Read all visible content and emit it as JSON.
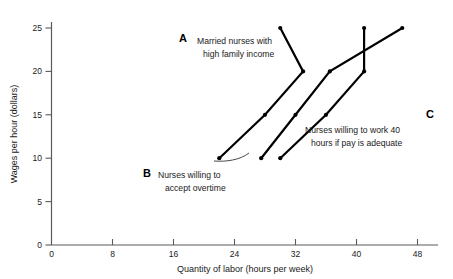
{
  "chart_data": {
    "type": "line",
    "title": "",
    "xlabel": "Quantity of labor (hours per week)",
    "ylabel": "Wages per hour (dollars)",
    "xlim": [
      0,
      50
    ],
    "ylim": [
      0,
      26
    ],
    "xticks": [
      0,
      8,
      16,
      24,
      32,
      40,
      48
    ],
    "yticks": [
      0,
      5,
      10,
      15,
      20,
      25
    ],
    "grid": false,
    "legend_position": "inline-annotations",
    "series": [
      {
        "key": "A",
        "letter": "A",
        "name": "Married nurses with high family income",
        "label_line1": "Married nurses with",
        "label_line2": "high family income",
        "backward_bending": true,
        "x": [
          22,
          28,
          33,
          30
        ],
        "y": [
          10,
          15,
          20,
          25
        ]
      },
      {
        "key": "B",
        "letter": "B",
        "name": "Nurses willing to accept overtime",
        "label_line1": "Nurses willing to",
        "label_line2": "accept overtime",
        "backward_bending": false,
        "x": [
          27.5,
          32,
          36.5,
          46
        ],
        "y": [
          10,
          15,
          20,
          25
        ]
      },
      {
        "key": "C",
        "letter": "C",
        "name": "Nurses willing to work 40 hours if pay is adequate",
        "label_line1": "Nurses willing to work 40",
        "label_line2": "hours if pay is adequate",
        "backward_bending": false,
        "x": [
          30,
          36,
          41,
          41
        ],
        "y": [
          10,
          15,
          20,
          25
        ]
      }
    ]
  },
  "axes": {
    "x_title": "Quantity of labor (hours per week)",
    "y_title": "Wages per hour (dollars)",
    "x_tick_labels": [
      "0",
      "8",
      "16",
      "24",
      "32",
      "40",
      "48"
    ],
    "y_tick_labels": [
      "0",
      "5",
      "10",
      "15",
      "20",
      "25"
    ],
    "origin_label": "0"
  },
  "annotations": {
    "a_letter": "A",
    "a_line1": "Married nurses with",
    "a_line2": "high family income",
    "b_letter": "B",
    "b_line1": "Nurses willing to",
    "b_line2": "accept overtime",
    "c_letter": "C",
    "c_line1": "Nurses willing to work 40",
    "c_line2": "hours if pay is adequate"
  },
  "colors": {
    "curve": "#000000",
    "axis": "#5a5a5a",
    "text": "#1a1a1a",
    "background": "#ffffff"
  }
}
